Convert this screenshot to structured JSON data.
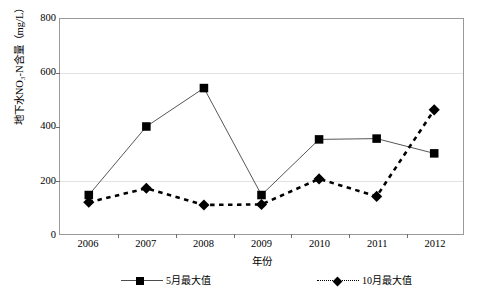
{
  "chart_data": {
    "type": "line",
    "title": "",
    "xlabel": "年份",
    "ylabel": "地下水NO₃-N含量（mg/L）",
    "categories": [
      "2006",
      "2007",
      "2008",
      "2009",
      "2010",
      "2011",
      "2012"
    ],
    "ylim": [
      0,
      800
    ],
    "yticks": [
      0,
      200,
      400,
      600,
      800
    ],
    "ytick_labels": [
      "0",
      "200",
      "400",
      "600",
      "800"
    ],
    "grid": "horizontal",
    "legend_position": "bottom",
    "series": [
      {
        "name": "5月最大值",
        "marker": "square",
        "line": "solid",
        "color": "#000000",
        "values": [
          145,
          400,
          543,
          145,
          352,
          355,
          300
        ]
      },
      {
        "name": "10月最大值",
        "marker": "diamond",
        "line": "dashed",
        "color": "#000000",
        "values": [
          118,
          170,
          108,
          110,
          205,
          140,
          462
        ]
      }
    ]
  },
  "caption": {
    "text": ""
  }
}
